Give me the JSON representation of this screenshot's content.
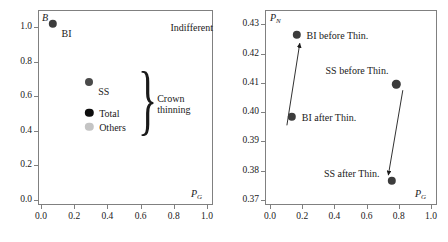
{
  "figure": {
    "panels": [
      {
        "id": "left",
        "xlabel": "P",
        "xlabel_sub": "G",
        "ylabel": "B",
        "ylabel_sub": "",
        "annotations": [
          {
            "name": "indifferent",
            "text": "Indifferent"
          },
          {
            "name": "crown-thinning-line1",
            "text": "Crown"
          },
          {
            "name": "crown-thinning-line2",
            "text": "thinning"
          }
        ],
        "point_labels": [
          "BI",
          "SS",
          "Total",
          "Others"
        ]
      },
      {
        "id": "right",
        "xlabel": "P",
        "xlabel_sub": "G",
        "ylabel": "P",
        "ylabel_sub": "N",
        "point_labels": [
          "BI before Thin.",
          "BI after Thin.",
          "SS before Thin.",
          "SS after Thin."
        ]
      }
    ]
  },
  "chart_data": [
    {
      "type": "scatter",
      "id": "left-panel",
      "title": "",
      "xlabel": "P_G",
      "ylabel": "B",
      "xlim": [
        0.0,
        1.0
      ],
      "ylim": [
        0.0,
        1.06
      ],
      "grid": false,
      "legend": "inline-labels",
      "xticks": [
        "0.0",
        "0.2",
        "0.4",
        "0.6",
        "0.8",
        "1.0"
      ],
      "xtick_values": [
        0.0,
        0.2,
        0.4,
        0.6,
        0.8,
        1.0
      ],
      "yticks": [
        "0.0",
        "0.2",
        "0.4",
        "0.6",
        "0.8",
        "1.0"
      ],
      "ytick_values": [
        0.0,
        0.2,
        0.4,
        0.6,
        0.8,
        1.0
      ],
      "points": [
        {
          "label": "BI",
          "x": 0.07,
          "y": 1.02,
          "color": "#3c3c3c",
          "radius": 4.2,
          "label_dx": 9,
          "label_dy": 9
        },
        {
          "label": "SS",
          "x": 0.29,
          "y": 0.685,
          "color": "#4a4a4a",
          "radius": 4.0,
          "label_dx": 9,
          "label_dy": 9
        },
        {
          "label": "Total",
          "x": 0.29,
          "y": 0.505,
          "color": "#0d0d0d",
          "radius": 4.2,
          "label_dx": 10,
          "label_dy": 0
        },
        {
          "label": "Others",
          "x": 0.29,
          "y": 0.425,
          "color": "#c4c4c4",
          "radius": 4.2,
          "label_dx": 10,
          "label_dy": 0
        }
      ],
      "annotations": [
        {
          "text": "Indifferent",
          "x": 0.78,
          "y": 1.0
        },
        {
          "text": "Crown thinning",
          "x": 0.7,
          "y": 0.555
        }
      ]
    },
    {
      "type": "scatter",
      "id": "right-panel",
      "title": "",
      "xlabel": "P_G",
      "ylabel": "P_N",
      "xlim": [
        0.0,
        1.0
      ],
      "ylim": [
        0.37,
        0.4325
      ],
      "grid": false,
      "legend": "inline-labels",
      "xticks": [
        "0.0",
        "0.2",
        "0.4",
        "0.6",
        "0.8",
        "1.0"
      ],
      "xtick_values": [
        0.0,
        0.2,
        0.4,
        0.6,
        0.8,
        1.0
      ],
      "yticks": [
        "0.37",
        "0.38",
        "0.39",
        "0.40",
        "0.41",
        "0.42",
        "0.43"
      ],
      "ytick_values": [
        0.37,
        0.38,
        0.39,
        0.4,
        0.41,
        0.42,
        0.43
      ],
      "points": [
        {
          "label": "BI before Thin.",
          "x": 0.165,
          "y": 0.4265,
          "color": "#3c3c3c",
          "radius": 4.2,
          "label_dx": 10,
          "label_dy": 0
        },
        {
          "label": "BI after Thin.",
          "x": 0.135,
          "y": 0.3985,
          "color": "#3c3c3c",
          "radius": 4.2,
          "label_dx": 10,
          "label_dy": 0
        },
        {
          "label": "SS before Thin.",
          "x": 0.785,
          "y": 0.4095,
          "color": "#3c3c3c",
          "radius": 4.2,
          "label_dx": -8,
          "label_dy": -14,
          "label_anchor": "end"
        },
        {
          "label": "SS after Thin.",
          "x": 0.755,
          "y": 0.3765,
          "color": "#3c3c3c",
          "radius": 4.2,
          "label_dx": -12,
          "label_dy": -8,
          "label_anchor": "end"
        }
      ],
      "arrows": [
        {
          "name": "bi-arrow",
          "from_x": 0.105,
          "from_y": 0.3955,
          "to_x": 0.185,
          "to_y": 0.4235,
          "direction": "up-right"
        },
        {
          "name": "ss-arrow",
          "from_x": 0.825,
          "from_y": 0.4075,
          "to_x": 0.735,
          "to_y": 0.3785,
          "direction": "down-left"
        }
      ]
    }
  ]
}
